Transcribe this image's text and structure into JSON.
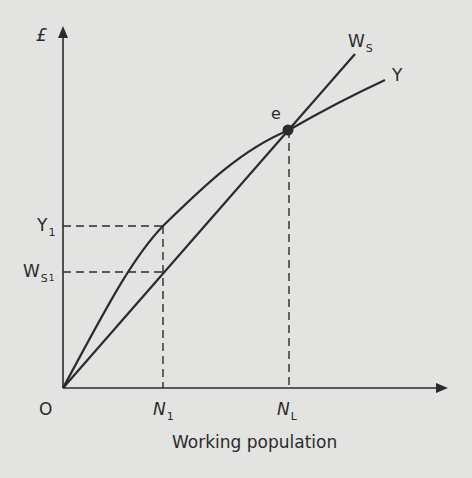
{
  "diagram": {
    "title": "",
    "y_axis_label": "£",
    "x_axis_label": "Working population",
    "origin_label": "O",
    "curves": [
      {
        "name": "W_S",
        "label": "W",
        "subscript": "S",
        "type": "line",
        "description": "Wage bill / subsistence line, straight from origin"
      },
      {
        "name": "Y",
        "label": "Y",
        "type": "concave curve",
        "description": "Total output curve, concave from origin"
      }
    ],
    "points": [
      {
        "name": "e",
        "label": "e",
        "description": "Intersection of W_S and Y"
      }
    ],
    "y_markers": [
      {
        "label": "Y",
        "subscript": "1"
      },
      {
        "label": "W",
        "subscript": "S",
        "subsubscript": "1"
      }
    ],
    "x_markers": [
      {
        "label": "N",
        "subscript": "1"
      },
      {
        "label": "N",
        "subscript": "L"
      }
    ],
    "colors": {
      "background": "#e3e3e1",
      "line": "#2b2b2b"
    }
  }
}
